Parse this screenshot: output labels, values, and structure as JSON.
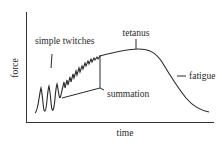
{
  "diagram": {
    "type": "muscle-force-time-curve",
    "axes": {
      "y_label": "force",
      "x_label": "time"
    },
    "annotations": {
      "simple_twitches": "simple twitches",
      "summation": "summation",
      "tetanus": "tetanus",
      "fatigue": "fatigue"
    },
    "colors": {
      "line": "#2a2a2a",
      "background": "#ffffff"
    }
  }
}
